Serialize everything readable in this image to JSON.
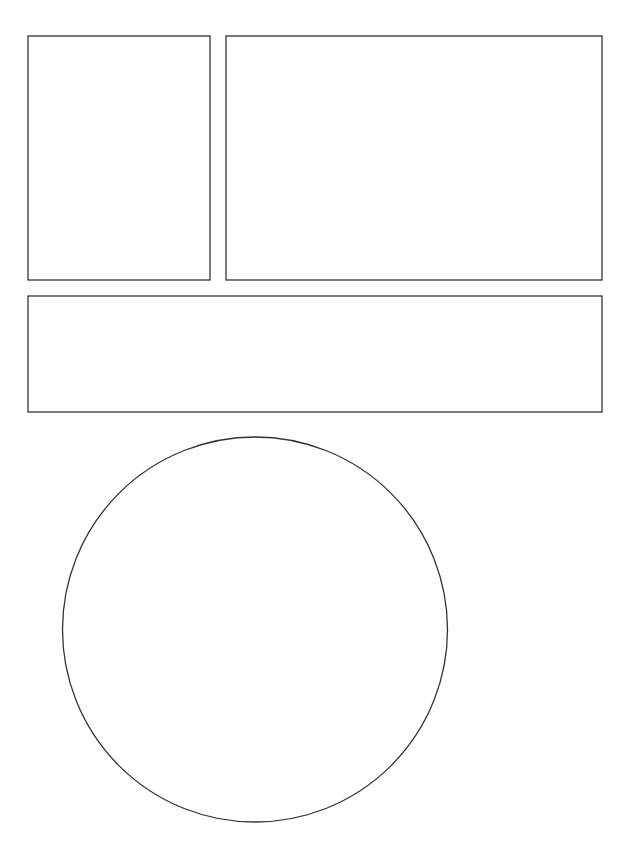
{
  "canvas": {
    "width": 633,
    "height": 845,
    "background": "#ffffff",
    "stroke_color": "#333333",
    "stroke_width": 1.3
  },
  "shapes": {
    "rect_top_left": {
      "type": "rect",
      "x": 28,
      "y": 36,
      "width": 182,
      "height": 244
    },
    "rect_top_right": {
      "type": "rect",
      "x": 226,
      "y": 36,
      "width": 376,
      "height": 244
    },
    "rect_wide": {
      "type": "rect",
      "x": 28,
      "y": 296,
      "width": 574,
      "height": 116
    },
    "circle": {
      "type": "circle",
      "cx": 255,
      "cy": 629.5,
      "r": 192.5
    }
  }
}
